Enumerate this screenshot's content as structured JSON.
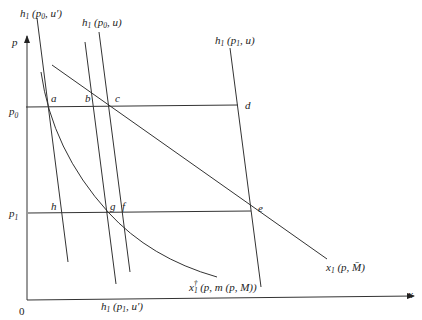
{
  "diagram": {
    "type": "economics-demand-curves",
    "axes": {
      "y_label": "p",
      "x_label": "x",
      "origin_label": "0",
      "price_levels": [
        {
          "label": "p",
          "sub": "0",
          "name": "p0"
        },
        {
          "label": "p",
          "sub": "1",
          "name": "p1"
        }
      ]
    },
    "curves": [
      {
        "name": "hicksian-p0-uprime",
        "label_main": "h",
        "label_sub": "1",
        "label_args": " (p",
        "label_args_sub": "0",
        "label_tail": ", u′)"
      },
      {
        "name": "hicksian-p0-u",
        "label_main": "h",
        "label_sub": "1",
        "label_args": " (p",
        "label_args_sub": "0",
        "label_tail": ", u)"
      },
      {
        "name": "hicksian-p1-u",
        "label_main": "h",
        "label_sub": "1",
        "label_args": " (p",
        "label_args_sub": "1",
        "label_tail": ", u)"
      },
      {
        "name": "hicksian-p1-uprime",
        "label_main": "h",
        "label_sub": "1",
        "label_args": " (p",
        "label_args_sub": "1",
        "label_tail": ", u′)"
      },
      {
        "name": "marshallian-fixed-income",
        "label_main": "x",
        "label_sub": "1",
        "label_tail": " (p, M̄)"
      },
      {
        "name": "compensated-demand",
        "label_main": "x",
        "label_sub": "1",
        "label_dagger": "†",
        "label_tail": " (p, m (p, M))"
      }
    ],
    "points": [
      {
        "label": "a"
      },
      {
        "label": "b"
      },
      {
        "label": "c"
      },
      {
        "label": "d"
      },
      {
        "label": "e"
      },
      {
        "label": "f"
      },
      {
        "label": "g"
      },
      {
        "label": "h"
      }
    ],
    "colors": {
      "line": "#333333",
      "text": "#222222",
      "background": "#ffffff"
    }
  }
}
